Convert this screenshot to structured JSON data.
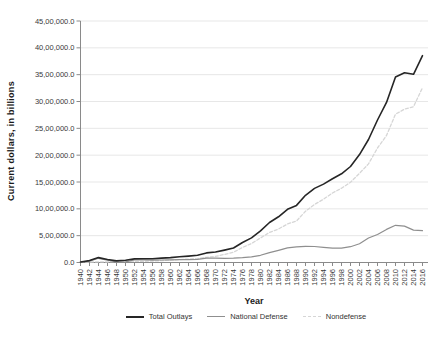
{
  "colors": {
    "grid": "#e7e7e7",
    "axis": "#8a8a8a",
    "tick_text": "#3a3a3a",
    "total_outlays": "#262626",
    "national_defense": "#8f8f8f",
    "nondefense": "#d6d6d6"
  },
  "chart_data": {
    "type": "line",
    "title": "",
    "xlabel": "Year",
    "ylabel": "Current  dollars, in billions",
    "ylim": [
      0,
      4500000
    ],
    "y_tick_interval": 500000,
    "y_tick_labels": [
      "0.0",
      "5,00,000.0",
      "10,00,000.0",
      "15,00,000.0",
      "20,00,000.0",
      "25,00,000.0",
      "30,00,000.0",
      "35,00,000.0",
      "40,00,000.0",
      "45,00,000.0"
    ],
    "grid": true,
    "legend_position": "bottom",
    "x": [
      1940,
      1942,
      1944,
      1946,
      1948,
      1950,
      1952,
      1954,
      1956,
      1958,
      1960,
      1962,
      1964,
      1966,
      1968,
      1970,
      1972,
      1974,
      1976,
      1978,
      1980,
      1982,
      1984,
      1986,
      1988,
      1990,
      1992,
      1994,
      1996,
      1998,
      2000,
      2002,
      2004,
      2006,
      2008,
      2010,
      2012,
      2014,
      2016
    ],
    "series": [
      {
        "name": "Total Outlays",
        "color": "#262626",
        "dash": "solid",
        "width": 1.6,
        "values": [
          9468,
          35137,
          91304,
          55233,
          29764,
          42562,
          67686,
          70855,
          70640,
          82405,
          92191,
          106821,
          118528,
          134532,
          178134,
          195649,
          230681,
          269359,
          371792,
          458746,
          590941,
          745743,
          851805,
          990382,
          1064416,
          1252993,
          1381529,
          1461752,
          1560484,
          1652458,
          1788950,
          2010894,
          2292841,
          2655050,
          2982544,
          3457079,
          3536951,
          3506114,
          3852612
        ]
      },
      {
        "name": "National Defense",
        "color": "#8f8f8f",
        "dash": "solid",
        "width": 1.2,
        "values": [
          1660,
          25658,
          79143,
          42681,
          9105,
          13724,
          46089,
          49266,
          42523,
          46815,
          48130,
          52345,
          54757,
          58111,
          81926,
          81692,
          79174,
          79347,
          89619,
          104495,
          133995,
          185309,
          227413,
          273375,
          290361,
          299331,
          298350,
          281642,
          265753,
          268207,
          294363,
          348456,
          455813,
          521820,
          616073,
          693485,
          677852,
          603457,
          593372
        ]
      },
      {
        "name": "Nondefense",
        "color": "#d6d6d6",
        "dash": "dashed",
        "width": 1.3,
        "values": [
          7808,
          9479,
          12161,
          12552,
          20659,
          28838,
          21597,
          21589,
          28117,
          35590,
          44061,
          54476,
          63771,
          76421,
          96208,
          113957,
          151507,
          190012,
          282173,
          354251,
          456946,
          560434,
          624392,
          717007,
          774055,
          953662,
          1083179,
          1180110,
          1294731,
          1384251,
          1494587,
          1662438,
          1837028,
          2133230,
          2366471,
          2763594,
          2859099,
          2902657,
          3259240
        ]
      }
    ]
  }
}
